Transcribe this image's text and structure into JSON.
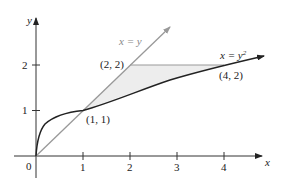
{
  "axes": {
    "x_label": "x",
    "y_label": "y",
    "origin_label": "0",
    "x_ticks": [
      "1",
      "2",
      "3",
      "4"
    ],
    "y_ticks": [
      "1",
      "2"
    ]
  },
  "curves": {
    "line_label": "x = y",
    "parabola_label_base": "x = y",
    "parabola_label_exp": "2"
  },
  "points": {
    "p1": "(1, 1)",
    "p2": "(2, 2)",
    "p3": "(4, 2)"
  },
  "colors": {
    "line": "#999999",
    "curve": "#222222",
    "shade": "#eeeeee",
    "axis": "#333333"
  }
}
